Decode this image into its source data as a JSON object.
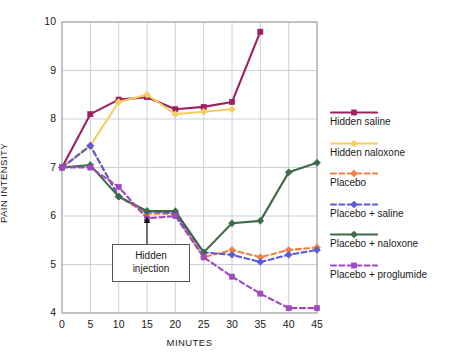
{
  "chart_data": {
    "type": "line",
    "title": "",
    "xlabel": "MINUTES",
    "ylabel": "PAIN INTENSITY",
    "xlim": [
      0,
      45
    ],
    "ylim": [
      4,
      10
    ],
    "xticks": [
      0,
      5,
      10,
      15,
      20,
      25,
      30,
      35,
      40,
      45
    ],
    "yticks": [
      4,
      5,
      6,
      7,
      8,
      9,
      10
    ],
    "grid": true,
    "legend_position": "right",
    "annotations": [
      {
        "text": "Hidden injection",
        "line1": "Hidden",
        "line2": "injection",
        "points_to_x": 15,
        "points_to_y": 6.05
      }
    ],
    "series": [
      {
        "name": "Hidden saline",
        "color": "#9E2060",
        "marker": "square",
        "dash": "solid",
        "x": [
          0,
          5,
          10,
          15,
          20,
          25,
          30,
          35
        ],
        "values": [
          7.0,
          8.1,
          8.4,
          8.45,
          8.2,
          8.25,
          8.35,
          9.8
        ]
      },
      {
        "name": "Hidden naloxone",
        "color": "#F5CE62",
        "marker": "diamond",
        "dash": "solid",
        "x": [
          0,
          5,
          10,
          15,
          20,
          25,
          30
        ],
        "values": [
          7.0,
          7.45,
          8.35,
          8.5,
          8.1,
          8.15,
          8.2
        ]
      },
      {
        "name": "Placebo",
        "color": "#EE8145",
        "marker": "diamond",
        "dash": "dashed",
        "x": [
          0,
          5,
          10,
          15,
          20,
          25,
          30,
          35,
          40,
          45
        ],
        "values": [
          7.0,
          7.45,
          6.4,
          6.05,
          6.05,
          5.15,
          5.3,
          5.15,
          5.3,
          5.35
        ]
      },
      {
        "name": "Placebo + saline",
        "color": "#5B5BD6",
        "marker": "diamond",
        "dash": "dashed",
        "x": [
          0,
          5,
          10,
          15,
          20,
          25,
          30,
          35,
          40,
          45
        ],
        "values": [
          7.0,
          7.45,
          6.4,
          6.1,
          6.05,
          5.25,
          5.2,
          5.05,
          5.2,
          5.3
        ]
      },
      {
        "name": "Placebo + naloxone",
        "color": "#3D6B4A",
        "marker": "diamond",
        "dash": "solid",
        "x": [
          0,
          5,
          10,
          15,
          20,
          25,
          30,
          35,
          40,
          45
        ],
        "values": [
          7.0,
          7.05,
          6.4,
          6.1,
          6.1,
          5.25,
          5.85,
          5.9,
          6.9,
          7.1
        ]
      },
      {
        "name": "Placebo + proglumide",
        "color": "#A148BE",
        "marker": "square",
        "dash": "dashed",
        "x": [
          0,
          5,
          10,
          15,
          20,
          25,
          30,
          35,
          40,
          45
        ],
        "values": [
          7.0,
          7.0,
          6.6,
          5.95,
          6.0,
          5.15,
          4.75,
          4.4,
          4.1,
          4.1
        ]
      }
    ]
  },
  "legend": {
    "items": [
      {
        "label": "Hidden saline"
      },
      {
        "label": "Hidden naloxone"
      },
      {
        "label": "Placebo"
      },
      {
        "label": "Placebo + saline"
      },
      {
        "label": "Placebo + naloxone"
      },
      {
        "label": "Placebo + proglumide"
      }
    ]
  },
  "colors": {
    "grid": "#BFC4CC",
    "axis": "#9AA0A8",
    "text": "#1a1a1a",
    "annotation_border": "#555555",
    "background": "#ffffff"
  }
}
